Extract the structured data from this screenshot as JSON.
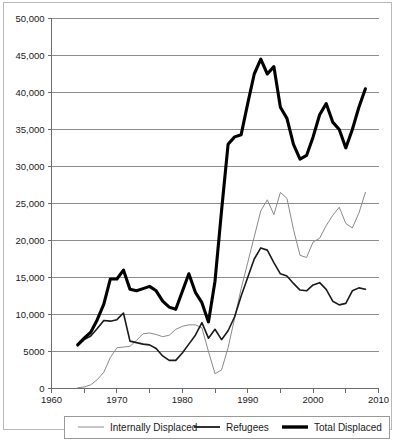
{
  "chart_data": {
    "type": "line",
    "title": "",
    "xlabel": "",
    "ylabel": "",
    "xlim": [
      1960,
      2010
    ],
    "ylim": [
      0,
      50000
    ],
    "grid": true,
    "legend_position": "bottom",
    "x_ticks": [
      1960,
      1970,
      1980,
      1990,
      2000,
      2010
    ],
    "x_tick_labels": [
      "1960",
      "1970",
      "1980",
      "1990",
      "2000",
      "2010"
    ],
    "x_minor_ticks": [
      1965,
      1975,
      1985,
      1995,
      2005
    ],
    "y_ticks": [
      0,
      5000,
      10000,
      15000,
      20000,
      25000,
      30000,
      35000,
      40000,
      45000,
      50000
    ],
    "y_tick_labels": [
      "0",
      "5000",
      "10,000",
      "15,000",
      "20,000",
      "25,000",
      "30,000",
      "35,000",
      "40,000",
      "45,000",
      "50,000"
    ],
    "series": [
      {
        "name": "Internally Displaced",
        "color": "#8a8a8a",
        "stroke_width": 1,
        "x": [
          1964,
          1965,
          1966,
          1967,
          1968,
          1969,
          1970,
          1971,
          1972,
          1973,
          1974,
          1975,
          1976,
          1977,
          1978,
          1979,
          1980,
          1981,
          1982,
          1983,
          1984,
          1985,
          1986,
          1987,
          1988,
          1989,
          1990,
          1991,
          1992,
          1993,
          1994,
          1995,
          1996,
          1997,
          1998,
          1999,
          2000,
          2001,
          2002,
          2003,
          2004,
          2005,
          2006,
          2007,
          2008
        ],
        "values": [
          100,
          200,
          500,
          1200,
          2200,
          4200,
          5500,
          5600,
          5700,
          6500,
          7400,
          7500,
          7300,
          7000,
          7200,
          8000,
          8400,
          8600,
          8600,
          8200,
          5000,
          2000,
          2500,
          5500,
          9500,
          13500,
          17000,
          20500,
          24000,
          25500,
          23500,
          26500,
          25700,
          21500,
          18000,
          17700,
          19800,
          20300,
          22000,
          23400,
          24500,
          22300,
          21700,
          23700,
          26500
        ]
      },
      {
        "name": "Refugees",
        "color": "#1a1a1a",
        "stroke_width": 1.6,
        "x": [
          1964,
          1965,
          1966,
          1967,
          1968,
          1969,
          1970,
          1971,
          1972,
          1973,
          1974,
          1975,
          1976,
          1977,
          1978,
          1979,
          1980,
          1981,
          1982,
          1983,
          1984,
          1985,
          1986,
          1987,
          1988,
          1989,
          1990,
          1991,
          1992,
          1993,
          1994,
          1995,
          1996,
          1997,
          1998,
          1999,
          2000,
          2001,
          2002,
          2003,
          2004,
          2005,
          2006,
          2007,
          2008
        ],
        "values": [
          5800,
          6600,
          7100,
          8100,
          9200,
          9100,
          9300,
          10200,
          6400,
          6200,
          6000,
          5900,
          5400,
          4400,
          3800,
          3800,
          4800,
          6000,
          7200,
          8900,
          6800,
          8000,
          6600,
          7800,
          9700,
          12500,
          15000,
          17500,
          19000,
          18700,
          17000,
          15500,
          15200,
          14200,
          13300,
          13200,
          14000,
          14300,
          13400,
          11800,
          11300,
          11500,
          13200,
          13600,
          13400
        ]
      },
      {
        "name": "Total Displaced",
        "color": "#000000",
        "stroke_width": 3.1,
        "x": [
          1964,
          1965,
          1966,
          1967,
          1968,
          1969,
          1970,
          1971,
          1972,
          1973,
          1974,
          1975,
          1976,
          1977,
          1978,
          1979,
          1980,
          1981,
          1982,
          1983,
          1984,
          1985,
          1986,
          1987,
          1988,
          1989,
          1990,
          1991,
          1992,
          1993,
          1994,
          1995,
          1996,
          1997,
          1998,
          1999,
          2000,
          2001,
          2002,
          2003,
          2004,
          2005,
          2006,
          2007,
          2008
        ],
        "values": [
          5900,
          6800,
          7600,
          9300,
          11400,
          14800,
          14800,
          16000,
          13400,
          13200,
          13500,
          13800,
          13200,
          11800,
          11000,
          10700,
          13100,
          15500,
          13000,
          11600,
          9000,
          14500,
          24000,
          33000,
          34000,
          34300,
          38500,
          42500,
          44500,
          42500,
          43500,
          38000,
          36500,
          33000,
          31000,
          31500,
          34000,
          37000,
          38500,
          36000,
          35000,
          32500,
          35000,
          38000,
          40500
        ]
      }
    ]
  },
  "legend": {
    "items": [
      {
        "label": "Internally Displaced",
        "color": "#8a8a8a",
        "width": 1
      },
      {
        "label": "Refugees",
        "color": "#1a1a1a",
        "width": 1.8
      },
      {
        "label": "Total Displaced",
        "color": "#000000",
        "width": 3.4
      }
    ]
  }
}
